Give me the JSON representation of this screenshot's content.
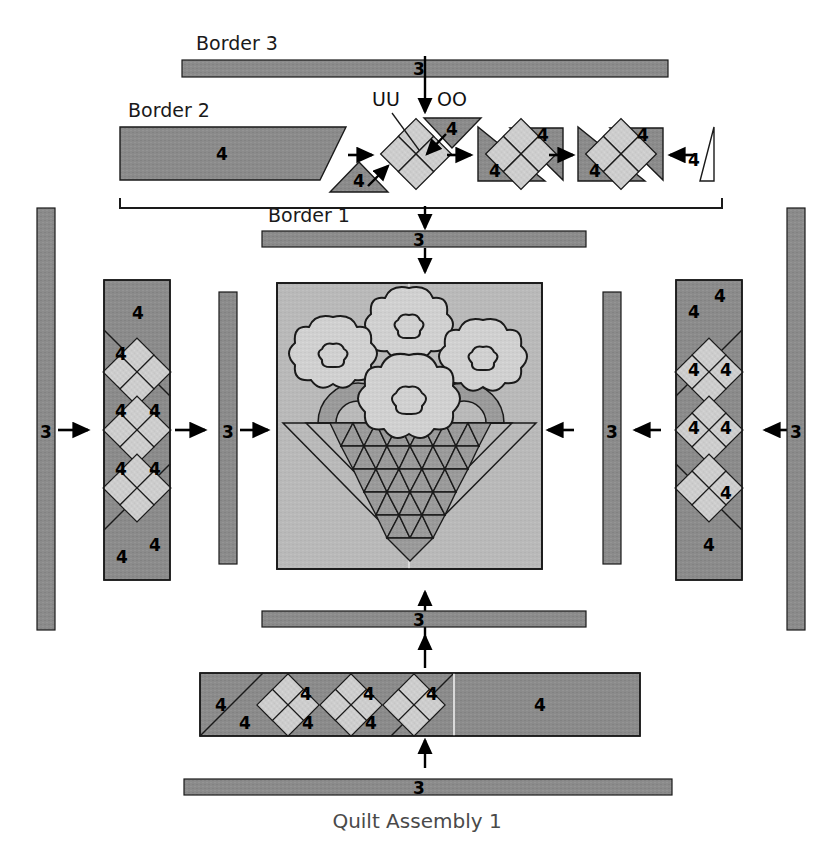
{
  "figure": {
    "caption": "Quilt Assembly 1",
    "type": "quilt-assembly-diagram"
  },
  "labels": {
    "border3": "Border 3",
    "border2": "Border 2",
    "border1": "Border 1",
    "unit_uu": "UU",
    "unit_oo": "OO"
  },
  "fabric_codes": {
    "strip": "3",
    "patch": "4"
  },
  "colors": {
    "dark_fabric": "#8b8b8b",
    "light_fabric": "#cdcdcd",
    "block_background": "#b9b9b9",
    "flower": "#d0d0d0",
    "basket_triangle": "#9a9a9a",
    "outline": "#1a1a1a",
    "page_background": "#ffffff"
  },
  "top_section": {
    "border3_strip": {
      "code": "3"
    },
    "border2_row": {
      "left_parallelogram_code": "4",
      "bottom_triangle_code": "4",
      "uu_fourpatch_code": "",
      "oo_triangle_code": "4",
      "unit_a_triangle_code": "4",
      "unit_a_corner_code": "4",
      "unit_b_triangle_code": "4",
      "unit_b_corner_code": "4",
      "right_triangle_code": "4"
    },
    "border1_strip": {
      "code": "3"
    }
  },
  "left_side": {
    "outer_strip_code": "3",
    "inner_strip_code": "3",
    "pieced_border_top_code": "4",
    "pieced_border_bottom_code": "4",
    "diamond_labels": [
      "4",
      "4",
      "4",
      "4",
      "4",
      "4",
      "4",
      "4"
    ]
  },
  "right_side": {
    "outer_strip_code": "3",
    "inner_strip_code": "3",
    "pieced_border_top_code": "4",
    "pieced_border_bottom_code": "4",
    "diamond_labels": [
      "4",
      "4",
      "4",
      "4",
      "4",
      "4",
      "4",
      "4"
    ]
  },
  "center_block": {
    "flower_count": 4,
    "handle_count": 2,
    "basket_rows": 6,
    "description": "flower basket block"
  },
  "bottom_section": {
    "inner_strip_code": "3",
    "pieced_border": {
      "left_code": "4",
      "right_code": "4",
      "diamond_labels": [
        "4",
        "4",
        "4",
        "4",
        "4",
        "4",
        "4",
        "4"
      ]
    },
    "outer_strip_code": "3"
  },
  "arrows": {
    "count": 14,
    "directions": [
      "down",
      "down",
      "down",
      "right",
      "right",
      "right",
      "right",
      "left",
      "right",
      "right",
      "left",
      "left",
      "up",
      "up",
      "up"
    ]
  }
}
